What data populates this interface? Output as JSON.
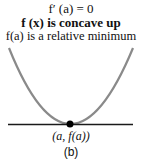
{
  "labels": {
    "derivative": "f′ (a) = 0",
    "concavity": "f (x) is concave up",
    "extremum": "f(a) is a relative minimum",
    "point": "(a, f(a))",
    "caption": "(b)"
  },
  "colors": {
    "curve": "#8a8a8a",
    "tangent": "#1a1a1a",
    "point": "#000000"
  }
}
